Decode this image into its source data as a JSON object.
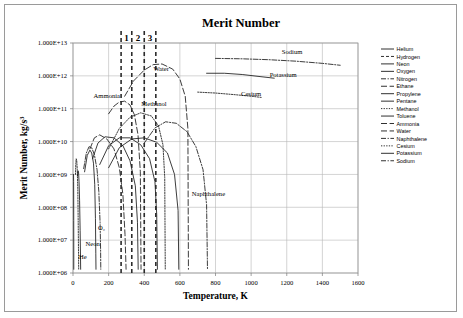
{
  "chart_data": {
    "type": "line",
    "title": "Merit Number",
    "xlabel": "Temperature, K",
    "ylabel": "Merit Number, kg/s³",
    "xlim": [
      0,
      1600
    ],
    "ylim": [
      1000000,
      10000000000000.0
    ],
    "yscale": "log",
    "grid": true,
    "legend_position": "right",
    "xticks": [
      "0",
      "200",
      "400",
      "600",
      "800",
      "1000",
      "1200",
      "1400",
      "1600"
    ],
    "xtick_values": [
      0,
      200,
      400,
      600,
      800,
      1000,
      1200,
      1400,
      1600
    ],
    "yticks": [
      "1.000E+06",
      "1.000E+07",
      "1.000E+08",
      "1.000E+09",
      "1.000E+10",
      "1.000E+11",
      "1.000E+12",
      "1.000E+13"
    ],
    "ytick_values": [
      1000000.0,
      10000000.0,
      100000000.0,
      1000000000.0,
      10000000000.0,
      100000000000.0,
      1000000000000.0,
      10000000000000.0
    ],
    "zone_markers": [
      {
        "label": "1",
        "x_start": 270,
        "x_end": 330
      },
      {
        "label": "2",
        "x_start": 330,
        "x_end": 400
      },
      {
        "label": "3",
        "x_start": 400,
        "x_end": 465
      }
    ],
    "vertical_divider_x": [
      270,
      330,
      400,
      465
    ],
    "annotations": [
      {
        "text": "Ammonia",
        "x": 190,
        "y": 220000000000.0
      },
      {
        "text": "Water",
        "x": 495,
        "y": 1400000000000.0
      },
      {
        "text": "Methanol",
        "x": 455,
        "y": 120000000000.0
      },
      {
        "text": "Naphthalene",
        "x": 760,
        "y": 220000000.0
      },
      {
        "text": "Sodium",
        "x": 1230,
        "y": 4600000000000.0
      },
      {
        "text": "Potassium",
        "x": 1180,
        "y": 900000000000.0
      },
      {
        "text": "Cesium",
        "x": 1000,
        "y": 240000000000.0
      },
      {
        "text": "O₂",
        "x": 160,
        "y": 20000000.0
      },
      {
        "text": "Neon",
        "x": 110,
        "y": 6500000.0
      },
      {
        "text": "He",
        "x": 55,
        "y": 2600000.0
      }
    ],
    "legend_entries": [
      {
        "name": "Helium",
        "style": "solid"
      },
      {
        "name": "Hydrogen",
        "style": "dashed"
      },
      {
        "name": "Neon",
        "style": "solid"
      },
      {
        "name": "Oxygen",
        "style": "solid"
      },
      {
        "name": "Nitrogen",
        "style": "dashdot"
      },
      {
        "name": "Ethane",
        "style": "longdash"
      },
      {
        "name": "Propylene",
        "style": "solid"
      },
      {
        "name": "Pentane",
        "style": "solid"
      },
      {
        "name": "Methanol",
        "style": "dotted"
      },
      {
        "name": "Toluene",
        "style": "solid"
      },
      {
        "name": "Ammonia",
        "style": "longdash"
      },
      {
        "name": "Water",
        "style": "longdash"
      },
      {
        "name": "Naphthalene",
        "style": "dashdot"
      },
      {
        "name": "Cesium",
        "style": "dotted"
      },
      {
        "name": "Potassium",
        "style": "solid"
      },
      {
        "name": "Sodium",
        "style": "dashdot"
      }
    ],
    "series": [
      {
        "name": "Helium",
        "style": "solid",
        "points": [
          [
            3,
            1000000000.0
          ],
          [
            3.4,
            600000000.0
          ],
          [
            3.8,
            220000000.0
          ],
          [
            4.1,
            40000000.0
          ],
          [
            4.3,
            5000000.0
          ],
          [
            4.4,
            1300000.0
          ]
        ]
      },
      {
        "name": "Hydrogen",
        "style": "dotted",
        "points": [
          [
            14,
            1000000000.0
          ],
          [
            16,
            2200000000.0
          ],
          [
            18,
            3000000000.0
          ],
          [
            21,
            2600000000.0
          ],
          [
            24,
            1400000000.0
          ],
          [
            27,
            350000000.0
          ],
          [
            29,
            45000000.0
          ],
          [
            31,
            4000000.0
          ],
          [
            32,
            1300000.0
          ]
        ]
      },
      {
        "name": "Neon",
        "style": "solid",
        "points": [
          [
            25,
            900000000.0
          ],
          [
            28,
            1300000000.0
          ],
          [
            31,
            1200000000.0
          ],
          [
            34,
            600000000.0
          ],
          [
            37,
            160000000.0
          ],
          [
            40,
            20000000.0
          ],
          [
            42,
            3500000.0
          ],
          [
            43,
            1300000.0
          ]
        ]
      },
      {
        "name": "Oxygen",
        "style": "dashdot",
        "points": [
          [
            60,
            1500000000.0
          ],
          [
            75,
            4500000000.0
          ],
          [
            90,
            7000000000.0
          ],
          [
            105,
            6500000000.0
          ],
          [
            120,
            4000000000.0
          ],
          [
            135,
            1400000000.0
          ],
          [
            145,
            300000000.0
          ],
          [
            152,
            35000000.0
          ],
          [
            155,
            5000000.0
          ],
          [
            156,
            1300000.0
          ]
        ]
      },
      {
        "name": "Nitrogen",
        "style": "solid",
        "points": [
          [
            65,
            1200000000.0
          ],
          [
            80,
            3800000000.0
          ],
          [
            95,
            5500000000.0
          ],
          [
            105,
            4500000000.0
          ],
          [
            115,
            2200000000.0
          ],
          [
            122,
            500000000.0
          ],
          [
            126,
            45000000.0
          ],
          [
            128,
            4000000.0
          ],
          [
            129,
            1300000.0
          ]
        ]
      },
      {
        "name": "Ethane",
        "style": "longdash",
        "points": [
          [
            95,
            6000000000.0
          ],
          [
            120,
            13000000000.0
          ],
          [
            150,
            16000000000.0
          ],
          [
            190,
            12000000000.0
          ],
          [
            230,
            6000000000.0
          ],
          [
            260,
            1600000000.0
          ],
          [
            280,
            250000000.0
          ],
          [
            292,
            15000000.0
          ],
          [
            298,
            1300000.0
          ]
        ]
      },
      {
        "name": "Propylene",
        "style": "solid",
        "points": [
          [
            110,
            3000000000.0
          ],
          [
            140,
            9000000000.0
          ],
          [
            180,
            14000000000.0
          ],
          [
            230,
            13000000000.0
          ],
          [
            280,
            7500000000.0
          ],
          [
            320,
            2600000000.0
          ],
          [
            350,
            450000000.0
          ],
          [
            362,
            35000000.0
          ],
          [
            366,
            1300000.0
          ]
        ]
      },
      {
        "name": "Pentane",
        "style": "solid",
        "points": [
          [
            150,
            2000000000.0
          ],
          [
            200,
            7500000000.0
          ],
          [
            260,
            13000000000.0
          ],
          [
            320,
            13000000000.0
          ],
          [
            380,
            8000000000.0
          ],
          [
            430,
            3000000000.0
          ],
          [
            460,
            600000000.0
          ],
          [
            470,
            60000000.0
          ],
          [
            474,
            1300000.0
          ]
        ]
      },
      {
        "name": "Methanol",
        "style": "dotted",
        "points": [
          [
            200,
            6000000000.0
          ],
          [
            260,
            25000000000.0
          ],
          [
            320,
            55000000000.0
          ],
          [
            380,
            75000000000.0
          ],
          [
            440,
            60000000000.0
          ],
          [
            480,
            30000000000.0
          ],
          [
            505,
            8000000000.0
          ],
          [
            515,
            800000000.0
          ],
          [
            518,
            1300000.0
          ]
        ]
      },
      {
        "name": "Toluene",
        "style": "solid",
        "points": [
          [
            200,
            1600000000.0
          ],
          [
            260,
            6500000000.0
          ],
          [
            330,
            12000000000.0
          ],
          [
            400,
            13000000000.0
          ],
          [
            470,
            9500000000.0
          ],
          [
            530,
            4500000000.0
          ],
          [
            570,
            1000000000.0
          ],
          [
            590,
            80000000.0
          ],
          [
            594,
            1300000.0
          ]
        ]
      },
      {
        "name": "Ammonia",
        "style": "longdash",
        "points": [
          [
            200,
            70000000000.0
          ],
          [
            230,
            120000000000.0
          ],
          [
            260,
            160000000000.0
          ],
          [
            290,
            170000000000.0
          ],
          [
            320,
            130000000000.0
          ],
          [
            345,
            65000000000.0
          ],
          [
            365,
            16000000000.0
          ],
          [
            378,
            1200000000.0
          ],
          [
            382,
            1300000.0
          ]
        ]
      },
      {
        "name": "Water",
        "style": "longdash",
        "points": [
          [
            290,
            240000000000.0
          ],
          [
            340,
            700000000000.0
          ],
          [
            400,
            1500000000000.0
          ],
          [
            450,
            2200000000000.0
          ],
          [
            500,
            2300000000000.0
          ],
          [
            560,
            1600000000000.0
          ],
          [
            600,
            800000000000.0
          ],
          [
            630,
            240000000000.0
          ],
          [
            645,
            25000000000.0
          ],
          [
            648,
            1300000.0
          ]
        ]
      },
      {
        "name": "Naphthalene",
        "style": "dashdot",
        "points": [
          [
            400,
            9000000000.0
          ],
          [
            460,
            26000000000.0
          ],
          [
            520,
            40000000000.0
          ],
          [
            580,
            36000000000.0
          ],
          [
            640,
            20000000000.0
          ],
          [
            690,
            7000000000.0
          ],
          [
            730,
            1400000000.0
          ],
          [
            750,
            120000000.0
          ],
          [
            755,
            1300000.0
          ]
        ]
      },
      {
        "name": "Cesium",
        "style": "dotted",
        "points": [
          [
            700,
            320000000000.0
          ],
          [
            800,
            300000000000.0
          ],
          [
            900,
            270000000000.0
          ],
          [
            1000,
            240000000000.0
          ],
          [
            1060,
            220000000000.0
          ]
        ]
      },
      {
        "name": "Potassium",
        "style": "solid",
        "points": [
          [
            750,
            1200000000000.0
          ],
          [
            850,
            1200000000000.0
          ],
          [
            950,
            1100000000000.0
          ],
          [
            1050,
            950000000000.0
          ],
          [
            1130,
            850000000000.0
          ]
        ]
      },
      {
        "name": "Sodium",
        "style": "dashdot",
        "points": [
          [
            800,
            3400000000000.0
          ],
          [
            950,
            3300000000000.0
          ],
          [
            1100,
            3100000000000.0
          ],
          [
            1250,
            2800000000000.0
          ],
          [
            1400,
            2400000000000.0
          ],
          [
            1500,
            2100000000000.0
          ]
        ]
      }
    ]
  }
}
